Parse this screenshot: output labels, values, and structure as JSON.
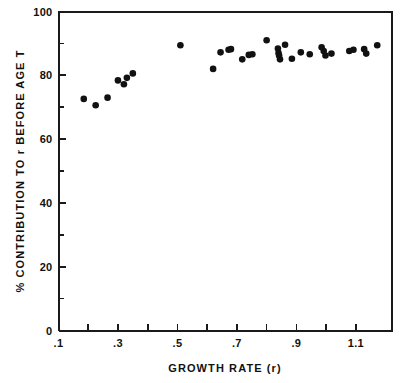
{
  "chart_data": {
    "type": "scatter",
    "title": "",
    "xlabel": "GROWTH RATE (r)",
    "ylabel": "% CONTRIBUTION TO r BEFORE AGE T",
    "xlim": [
      0.1,
      1.22
    ],
    "ylim": [
      0,
      100
    ],
    "grid": false,
    "legend": null,
    "marker": {
      "shape": "circle",
      "color": "#111111",
      "size_px": 4.4
    },
    "xticks": [
      0.1,
      0.2,
      0.3,
      0.4,
      0.5,
      0.6,
      0.7,
      0.8,
      0.9,
      1.0,
      1.1
    ],
    "xtick_labels": [
      ".1",
      "",
      ".3",
      "",
      ".5",
      "",
      ".7",
      "",
      ".9",
      "",
      "1.1"
    ],
    "xtick_labels_shown": [
      ".1",
      ".3",
      ".5",
      ".7",
      ".9",
      "1.1"
    ],
    "yticks": [
      0,
      10,
      20,
      30,
      40,
      50,
      60,
      70,
      80,
      90,
      100
    ],
    "ytick_labels": [
      "0",
      "",
      "20",
      "",
      "40",
      "",
      "60",
      "",
      "80",
      "",
      "100"
    ],
    "ytick_labels_shown": [
      "0",
      "20",
      "40",
      "60",
      "80",
      "100"
    ],
    "x": [
      0.185,
      0.225,
      0.265,
      0.3,
      0.32,
      0.33,
      0.35,
      0.51,
      0.62,
      0.645,
      0.672,
      0.68,
      0.718,
      0.74,
      0.752,
      0.8,
      0.838,
      0.84,
      0.842,
      0.845,
      0.862,
      0.885,
      0.915,
      0.945,
      0.985,
      0.992,
      0.998,
      1.018,
      1.078,
      1.092,
      1.128,
      1.135,
      1.172
    ],
    "y": [
      72.6,
      70.6,
      73.0,
      78.4,
      77.2,
      79.2,
      80.6,
      89.4,
      82.0,
      87.2,
      88.0,
      88.2,
      85.0,
      86.4,
      86.6,
      91.0,
      88.4,
      87.0,
      86.2,
      85.0,
      89.6,
      85.2,
      87.2,
      86.6,
      88.8,
      87.6,
      86.2,
      86.8,
      87.6,
      88.0,
      88.2,
      86.8,
      89.4
    ],
    "n_points": 33
  },
  "axes": {
    "x_title": "GROWTH RATE (r)",
    "y_title": "% CONTRIBUTION TO r BEFORE AGE T",
    "y_title_parts": [
      "%",
      "CONTRIBUTION",
      "TO",
      "r",
      "BEFORE",
      "AGE",
      "T"
    ],
    "x_title_parts": [
      "GROWTH",
      "RATE",
      "(r)"
    ]
  },
  "colors": {
    "axis": "#1a1a1a",
    "marker": "#111111",
    "background": "#ffffff",
    "text": "#111111"
  }
}
